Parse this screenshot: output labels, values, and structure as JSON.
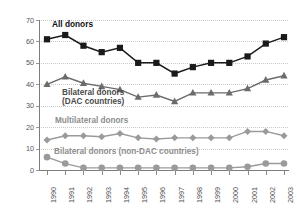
{
  "chart_data": {
    "type": "line",
    "title": "",
    "xlabel": "",
    "ylabel": "Constant 2002 US$ billions",
    "x": [
      "1990",
      "1991",
      "1992",
      "1993",
      "1994",
      "1995",
      "1996",
      "1997",
      "1998",
      "1999",
      "2000",
      "2001",
      "2002",
      "2003"
    ],
    "ylim": [
      0,
      70
    ],
    "yticks": [
      0,
      10,
      20,
      30,
      40,
      50,
      60,
      70
    ],
    "grid": true,
    "legend_position": "inline-annotations",
    "series": [
      {
        "name": "All donors",
        "marker": "square",
        "color": "#1a1a1a",
        "values": [
          61,
          63,
          58,
          55,
          57,
          50,
          50,
          45,
          48,
          50,
          50,
          53,
          59,
          62
        ]
      },
      {
        "name": "Bilateral donors (DAC countries)",
        "marker": "triangle",
        "color": "#6b6b6b",
        "values": [
          40,
          43.5,
          40.5,
          39,
          37.5,
          34,
          35,
          32,
          36,
          36,
          36,
          38,
          42,
          44
        ]
      },
      {
        "name": "Multilateral donors",
        "marker": "diamond",
        "color": "#9a9a9a",
        "values": [
          14,
          16,
          16,
          15.5,
          17,
          15,
          14.5,
          15,
          15,
          15,
          15,
          18,
          18,
          16
        ]
      },
      {
        "name": "Bilateral donors (non-DAC countries)",
        "marker": "circle",
        "color": "#9a9a9a",
        "values": [
          6,
          3,
          1,
          1,
          1,
          1,
          1,
          1,
          1,
          1,
          1,
          1.5,
          3,
          3
        ]
      }
    ],
    "annotations": [
      {
        "text": "All donors",
        "series": "All donors"
      },
      {
        "text": "Bilateral donors",
        "series": "Bilateral donors (DAC countries)"
      },
      {
        "text": "(DAC countries)",
        "series": "Bilateral donors (DAC countries)"
      },
      {
        "text": "Multilateral donors",
        "series": "Multilateral donors"
      },
      {
        "text": "Bilateral donors (non-DAC countries)",
        "series": "Bilateral donors (non-DAC countries)"
      }
    ]
  }
}
